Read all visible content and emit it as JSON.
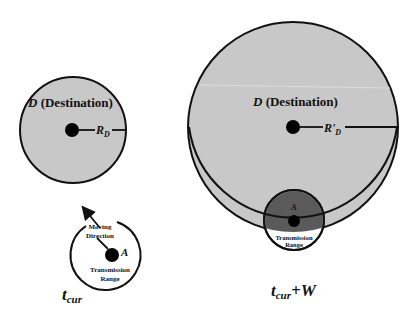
{
  "left_panel": {
    "destination_label_d": "D",
    "destination_label_rest": " (Destination)",
    "radius_label": "R",
    "radius_sub": "D",
    "moving_direction_line1": "Moving",
    "moving_direction_line2": "Direction",
    "node_label": "A",
    "transmission_line1": "Transmission",
    "transmission_line2": "Range",
    "time_label": "t",
    "time_sub": "cur"
  },
  "right_panel": {
    "destination_label_d": "D",
    "destination_label_rest": " (Destination)",
    "radius_label": "R'",
    "radius_sub": "D",
    "node_label": "A",
    "transmission_line1": "Transmission",
    "transmission_line2": "Range",
    "time_label": "t",
    "time_sub": "cur",
    "time_suffix": "+W"
  },
  "colors": {
    "destination_fill": "#c8c8c8",
    "transmission_fill_overlap": "#5a5a5a",
    "stroke": "#111111"
  }
}
